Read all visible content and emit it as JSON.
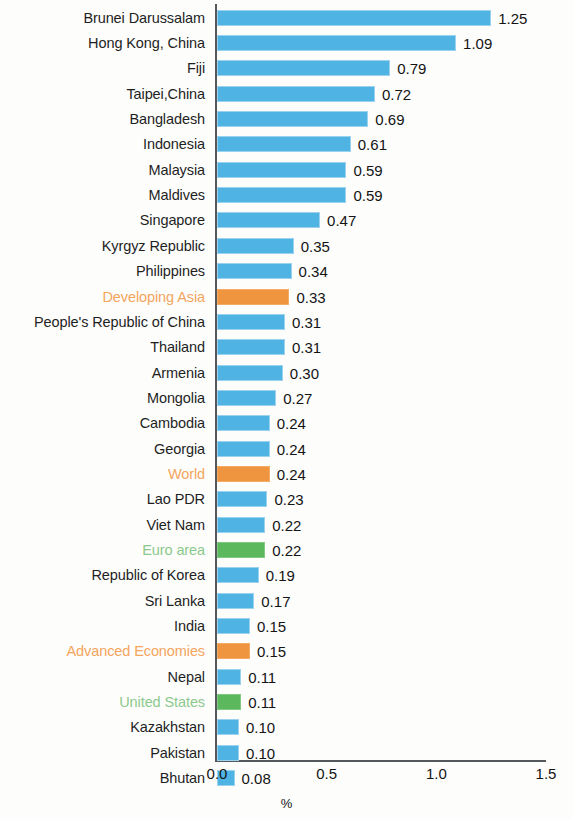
{
  "chart_data": {
    "type": "bar",
    "orientation": "horizontal",
    "title": "",
    "subtitle": "",
    "xlabel": "%",
    "ylabel": "",
    "xlim": [
      0,
      1.5
    ],
    "xticks": [
      "0.0",
      "0.5",
      "1.0",
      "1.5"
    ],
    "xtick_values": [
      0.0,
      0.5,
      1.0,
      1.5
    ],
    "grid": false,
    "legend": null,
    "value_label_format": "0.00",
    "colors": {
      "bar_default": "#4fb3e3",
      "bar_aggregate": "#f0953f",
      "bar_advanced": "#5cb85c",
      "label_default": "#1f1f1f",
      "label_aggregate": "#f4a55c",
      "label_advanced": "#8cc98c",
      "axis": "#55595c",
      "background": "#fdfdfc"
    },
    "categories": [
      "Brunei Darussalam",
      "Hong Kong, China",
      "Fiji",
      "Taipei,China",
      "Bangladesh",
      "Indonesia",
      "Malaysia",
      "Maldives",
      "Singapore",
      "Kyrgyz Republic",
      "Philippines",
      "Developing Asia",
      "People's Republic of China",
      "Thailand",
      "Armenia",
      "Mongolia",
      "Cambodia",
      "Georgia",
      "World",
      "Lao PDR",
      "Viet Nam",
      "Euro area",
      "Republic of Korea",
      "Sri Lanka",
      "India",
      "Advanced Economies",
      "Nepal",
      "United States",
      "Kazakhstan",
      "Pakistan",
      "Bhutan"
    ],
    "values": [
      1.25,
      1.09,
      0.79,
      0.72,
      0.69,
      0.61,
      0.59,
      0.59,
      0.47,
      0.35,
      0.34,
      0.33,
      0.31,
      0.31,
      0.3,
      0.27,
      0.24,
      0.24,
      0.24,
      0.23,
      0.22,
      0.22,
      0.19,
      0.17,
      0.15,
      0.15,
      0.11,
      0.11,
      0.1,
      0.1,
      0.08
    ],
    "value_labels": [
      "1.25",
      "1.09",
      "0.79",
      "0.72",
      "0.69",
      "0.61",
      "0.59",
      "0.59",
      "0.47",
      "0.35",
      "0.34",
      "0.33",
      "0.31",
      "0.31",
      "0.30",
      "0.27",
      "0.24",
      "0.24",
      "0.24",
      "0.23",
      "0.22",
      "0.22",
      "0.19",
      "0.17",
      "0.15",
      "0.15",
      "0.11",
      "0.11",
      "0.10",
      "0.10",
      "0.08"
    ],
    "bar_styles": [
      "blue",
      "blue",
      "blue",
      "blue",
      "blue",
      "blue",
      "blue",
      "blue",
      "blue",
      "blue",
      "blue",
      "orange",
      "blue",
      "blue",
      "blue",
      "blue",
      "blue",
      "blue",
      "orange",
      "blue",
      "blue",
      "green",
      "blue",
      "blue",
      "blue",
      "orange",
      "blue",
      "green",
      "blue",
      "blue",
      "blue"
    ]
  }
}
